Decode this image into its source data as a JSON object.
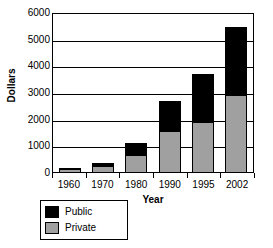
{
  "chart_data": {
    "type": "bar",
    "stacked": true,
    "title": "",
    "xlabel": "Year",
    "ylabel": "Dollars",
    "categories": [
      "1960",
      "1970",
      "1980",
      "1990",
      "1995",
      "2002"
    ],
    "series": [
      {
        "name": "Private",
        "color": "#a0a0a0",
        "values": [
          100,
          240,
          650,
          1530,
          1880,
          2900
        ]
      },
      {
        "name": "Public",
        "color": "#000000",
        "values": [
          60,
          110,
          420,
          1150,
          1790,
          2550
        ]
      }
    ],
    "totals": [
      160,
      350,
      1070,
      2680,
      3670,
      5450
    ],
    "ylim": [
      0,
      6000
    ],
    "ytick_values": [
      0,
      1000,
      2000,
      3000,
      4000,
      5000,
      6000
    ],
    "ytick_labels": [
      "0",
      "1000",
      "2000",
      "3000",
      "4000",
      "5000",
      "6000"
    ],
    "grid": true,
    "grid_axis": "y",
    "legend_position": "bottom-left",
    "legend": [
      "Public",
      "Private"
    ]
  }
}
